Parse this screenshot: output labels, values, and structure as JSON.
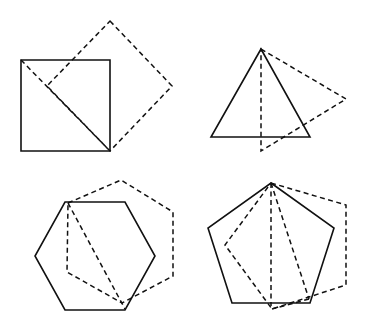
{
  "diagram": {
    "colors": {
      "background": "#ffffff",
      "stroke": "#111111"
    },
    "figures": [
      {
        "name": "square",
        "solid": [
          [
            21,
            60
          ],
          [
            110,
            60
          ],
          [
            110,
            151
          ],
          [
            21,
            151
          ]
        ],
        "dashed_polygon": [
          [
            110,
            21
          ],
          [
            172,
            86
          ],
          [
            110,
            151
          ],
          [
            47,
            86
          ]
        ],
        "dashed_lines": [
          [
            [
              21,
              60
            ],
            [
              110,
              151
            ]
          ]
        ]
      },
      {
        "name": "triangle",
        "solid": [
          [
            261,
            49
          ],
          [
            310,
            137
          ],
          [
            211,
            137
          ]
        ],
        "dashed_polygon": [
          [
            261,
            49
          ],
          [
            346,
            99
          ],
          [
            261,
            151
          ]
        ],
        "dashed_lines": []
      },
      {
        "name": "hexagon",
        "solid": [
          [
            65,
            202
          ],
          [
            125,
            202
          ],
          [
            155,
            256
          ],
          [
            125,
            310
          ],
          [
            65,
            310
          ],
          [
            35,
            256
          ]
        ],
        "dashed_polygon": [
          [
            68,
            203
          ],
          [
            121,
            180
          ],
          [
            173,
            212
          ],
          [
            173,
            276
          ],
          [
            122,
            303
          ],
          [
            67,
            272
          ]
        ],
        "dashed_lines": [
          [
            [
              68,
              203
            ],
            [
              125,
              309
            ]
          ]
        ]
      },
      {
        "name": "pentagon",
        "solid": [
          [
            271,
            183
          ],
          [
            334,
            228
          ],
          [
            310,
            303
          ],
          [
            232,
            303
          ],
          [
            208,
            228
          ]
        ],
        "dashed_polygon": [
          [
            271,
            183
          ],
          [
            346,
            205
          ],
          [
            346,
            285
          ],
          [
            272,
            309
          ],
          [
            225,
            245
          ]
        ],
        "dashed_lines": [
          [
            [
              271,
              183
            ],
            [
              271,
              306
            ]
          ],
          [
            [
              271,
              183
            ],
            [
              309,
              299
            ]
          ],
          [
            [
              309,
              299
            ],
            [
              272,
              309
            ]
          ]
        ]
      }
    ]
  }
}
